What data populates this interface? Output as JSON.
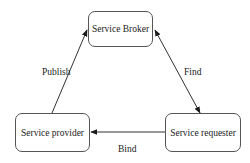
{
  "diagram": {
    "type": "service-oriented-architecture triangle",
    "nodes": {
      "broker": {
        "label": "Service Broker"
      },
      "provider": {
        "label": "Service provider"
      },
      "requester": {
        "label": "Service requester"
      }
    },
    "edges": {
      "publish": {
        "label": "Publish",
        "from": "Service provider",
        "to": "Service Broker",
        "direction": "single"
      },
      "find": {
        "label": "Find",
        "from": "Service requester",
        "to": "Service Broker",
        "direction": "double"
      },
      "bind": {
        "label": "Bind",
        "from": "Service requester",
        "to": "Service provider",
        "direction": "single"
      }
    },
    "colors": {
      "stroke": "#333333",
      "border": "#555555",
      "text": "#222222",
      "background": "#ffffff"
    }
  }
}
